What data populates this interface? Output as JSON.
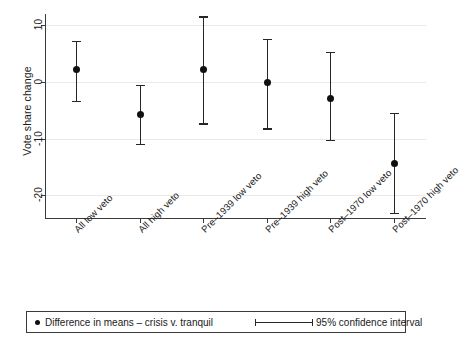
{
  "chart_data": {
    "type": "scatter",
    "title": "",
    "xlabel": "",
    "ylabel": "Vote share change",
    "ylim": [
      -24,
      12
    ],
    "yticks": [
      10,
      0,
      -10,
      -20
    ],
    "ytick_labels": [
      "10",
      "0",
      "-10",
      "-20"
    ],
    "grid": true,
    "categories": [
      "All low veto",
      "All high veto",
      "Pre–1939 low veto",
      "Pre–1939 high veto",
      "Post–1970 low veto",
      "Post–1970 high veto"
    ],
    "values": [
      2.2,
      -5.8,
      2.2,
      0.0,
      -2.9,
      -14.4
    ],
    "ci_low": [
      -3.3,
      -10.9,
      -7.3,
      -8.2,
      -10.2,
      -23.1
    ],
    "ci_high": [
      7.3,
      -0.5,
      11.6,
      7.6,
      5.3,
      -5.5
    ],
    "series": [
      {
        "name": "Difference in means – crisis v. tranquil",
        "values": [
          2.2,
          -5.8,
          2.2,
          0.0,
          -2.9,
          -14.4
        ]
      },
      {
        "name": "95% confidence interval",
        "low": [
          -3.3,
          -10.9,
          -7.3,
          -8.2,
          -10.2,
          -23.1
        ],
        "high": [
          7.3,
          -0.5,
          11.6,
          7.6,
          5.3,
          -5.5
        ]
      }
    ],
    "legend": {
      "position": "bottom",
      "entries": [
        {
          "marker": "dot",
          "label": "Difference in means – crisis v. tranquil"
        },
        {
          "marker": "errorbar",
          "label": "95% confidence interval"
        }
      ]
    },
    "colors": {
      "marker": "#101010",
      "errorbar": "#262626",
      "grid": "#e9e9e9",
      "axis": "#3a3a3a",
      "background": "#ffffff"
    }
  }
}
